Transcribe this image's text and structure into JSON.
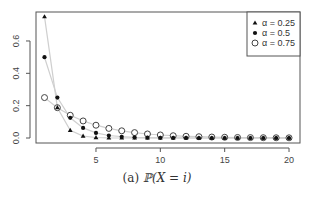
{
  "chart_data": {
    "type": "scatter",
    "title": "",
    "caption": "(a) ℙ(X = i)",
    "caption_label": "(a)",
    "caption_math": "ℙ(X = i)",
    "xlabel": "",
    "ylabel": "",
    "xlim": [
      0.5,
      20.5
    ],
    "ylim": [
      0,
      0.78
    ],
    "xticks": [
      5,
      10,
      15,
      20
    ],
    "yticks": [
      0.0,
      0.2,
      0.4,
      0.6
    ],
    "ytick_labels": [
      "0.0",
      "0.2",
      "0.4",
      "0.6"
    ],
    "xtick_labels": [
      "5",
      "10",
      "15",
      "20"
    ],
    "grid": false,
    "legend_position": "top-right",
    "x": [
      1,
      2,
      3,
      4,
      5,
      6,
      7,
      8,
      9,
      10,
      11,
      12,
      13,
      14,
      15,
      16,
      17,
      18,
      19,
      20
    ],
    "series": [
      {
        "name": "α = 0.25",
        "marker": "triangle",
        "values": [
          0.75,
          0.1875,
          0.0469,
          0.0117,
          0.0029,
          0.0007,
          0.0002,
          0.0,
          0.0,
          0.0,
          0.0,
          0.0,
          0.0,
          0.0,
          0.0,
          0.0,
          0.0,
          0.0,
          0.0,
          0.0
        ]
      },
      {
        "name": "α = 0.5",
        "marker": "filled-circle",
        "values": [
          0.5,
          0.25,
          0.125,
          0.0625,
          0.0313,
          0.0156,
          0.0078,
          0.0039,
          0.002,
          0.001,
          0.0005,
          0.0002,
          0.0001,
          0.0,
          0.0,
          0.0,
          0.0,
          0.0,
          0.0,
          0.0
        ]
      },
      {
        "name": "α = 0.75",
        "marker": "open-circle",
        "values": [
          0.25,
          0.1875,
          0.1406,
          0.1055,
          0.0791,
          0.0593,
          0.0445,
          0.0334,
          0.025,
          0.0188,
          0.0141,
          0.0106,
          0.0079,
          0.0059,
          0.0045,
          0.0033,
          0.0025,
          0.0019,
          0.0014,
          0.0011
        ]
      }
    ]
  },
  "legend": {
    "items": [
      {
        "label": "α = 0.25",
        "marker": "triangle"
      },
      {
        "label": "α = 0.5",
        "marker": "filled-circle"
      },
      {
        "label": "α = 0.75",
        "marker": "open-circle"
      }
    ]
  }
}
